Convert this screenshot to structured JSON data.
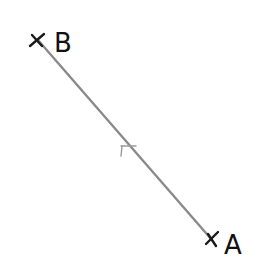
{
  "diagram": {
    "type": "line-segment",
    "line_color": "#8a8a8a",
    "mark_color": "#1a1a1a",
    "points": [
      {
        "name": "B",
        "label": "B",
        "x": 38,
        "y": 40,
        "marker": "x"
      },
      {
        "name": "A",
        "label": "A",
        "x": 212,
        "y": 240,
        "marker": "x"
      }
    ],
    "segment": {
      "from": "B",
      "to": "A"
    },
    "midpoint_tick": {
      "x": 124,
      "y": 146
    }
  }
}
